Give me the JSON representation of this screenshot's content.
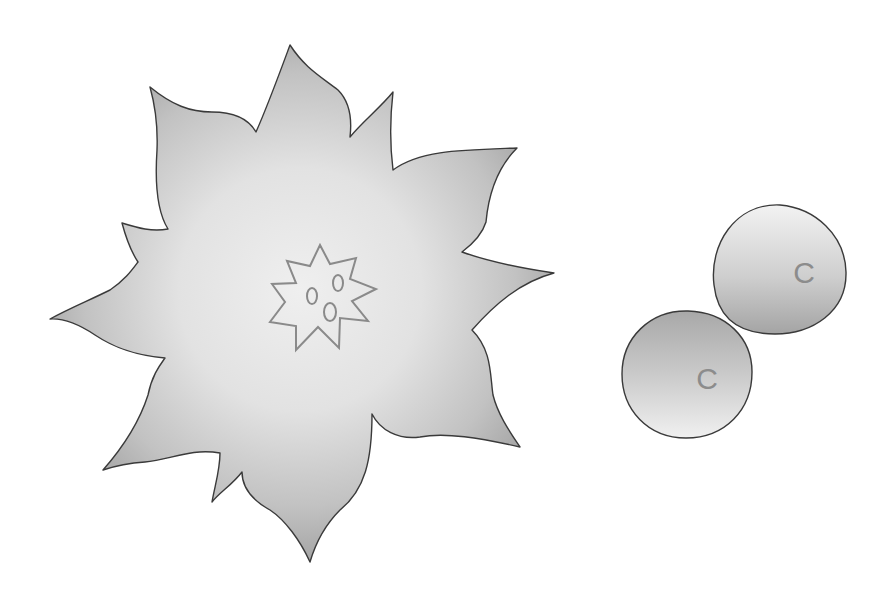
{
  "scene": {
    "description": "Illustration of a large spiky poinsettia-like flower and two round disc shapes labeled with the letter C",
    "background": "#ffffff"
  },
  "flower": {
    "label": "flower",
    "fill_light": "#ececec",
    "fill_dark": "#b4b4b4",
    "stroke": "#3a3a3a",
    "center": {
      "label": "flower-center",
      "stroke": "#8a8a8a",
      "marks": [
        "o",
        "o",
        "o"
      ]
    }
  },
  "discs": [
    {
      "label": "C",
      "id": "disc-upper-right"
    },
    {
      "label": "C",
      "id": "disc-lower-left"
    }
  ],
  "colors": {
    "outline": "#3a3a3a",
    "letter": "#8c8c8c",
    "grad_light": "#efefef",
    "grad_dark": "#a8a8a8"
  }
}
